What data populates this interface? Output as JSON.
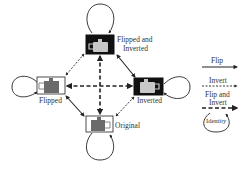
{
  "nodes": {
    "top": {
      "label_line1": "Flipped and",
      "label_line2": "Inverted",
      "style": "inverted"
    },
    "left": {
      "label": "Flipped",
      "style": "normal"
    },
    "right": {
      "label": "Inverted",
      "style": "inverted"
    },
    "bottom": {
      "label": "Original",
      "style": "normal"
    }
  },
  "legend": {
    "flip": "Flip",
    "invert": "Invert",
    "flip_invert_line1": "Flip and",
    "flip_invert_line2": "Invert",
    "identity": "Identity"
  },
  "colors": {
    "line": "#222222",
    "box_dark": "#111111",
    "teapot_dark": "#6b6b6b",
    "teapot_light": "#c8c8c8",
    "label": "#333333"
  }
}
